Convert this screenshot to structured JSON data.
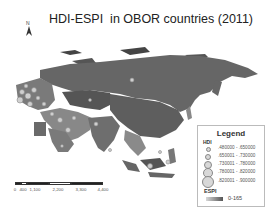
{
  "title": "HDI-ESPI  in OBOR countries (2011)",
  "north_arrow": {
    "label": "N",
    "icon": "north-arrow-icon"
  },
  "legend": {
    "title": "Legend",
    "hdi_label": "HDI",
    "hdi_classes": [
      {
        "range": ".480000 - .650000",
        "size": 3
      },
      {
        "range": ".650001 - .730000",
        "size": 4
      },
      {
        "range": ".730001 - .780000",
        "size": 6
      },
      {
        "range": ".780001 - .820000",
        "size": 8
      },
      {
        "range": ".820001 - .900000",
        "size": 10
      }
    ],
    "espi_label": "ESPI",
    "espi_range": "0-165"
  },
  "scale_bar": {
    "labels": [
      "0",
      "400",
      "1,100",
      "2,200",
      "3,300",
      "4,400"
    ],
    "unit": "Miles"
  },
  "colors": {
    "land_dark": "#5a5a5a",
    "land_mid": "#7a7a7a",
    "land_light": "#a8a8a8",
    "symbol_fill": "#d0d0d0",
    "background": "#ffffff"
  }
}
